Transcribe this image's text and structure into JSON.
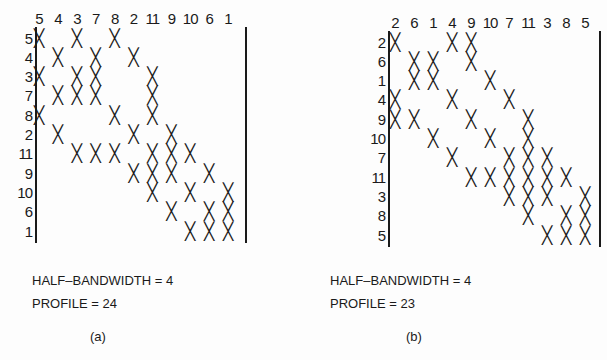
{
  "figure": {
    "panels": [
      {
        "id": "a",
        "label": "(a)",
        "column_order": [
          "5",
          "4",
          "3",
          "7",
          "8",
          "2",
          "11",
          "9",
          "10",
          "6",
          "1"
        ],
        "row_order": [
          "5",
          "4",
          "3",
          "7",
          "8",
          "2",
          "11",
          "9",
          "10",
          "6",
          "1"
        ],
        "mark": "X",
        "nonzeros": [
          [
            0,
            2,
            4
          ],
          [
            1,
            3,
            5
          ],
          [
            0,
            2,
            3,
            6
          ],
          [
            1,
            2,
            3,
            6
          ],
          [
            0,
            4,
            6
          ],
          [
            1,
            5,
            7
          ],
          [
            2,
            3,
            4,
            6,
            7,
            8
          ],
          [
            5,
            6,
            7,
            9
          ],
          [
            6,
            8,
            10
          ],
          [
            7,
            9,
            10
          ],
          [
            8,
            9,
            10
          ]
        ],
        "half_bandwidth_label": "HALF–BANDWIDTH = 4",
        "profile_label": "PROFILE = 24"
      },
      {
        "id": "b",
        "label": "(b)",
        "column_order": [
          "2",
          "6",
          "1",
          "4",
          "9",
          "10",
          "7",
          "11",
          "3",
          "8",
          "5"
        ],
        "row_order": [
          "2",
          "6",
          "1",
          "4",
          "9",
          "10",
          "7",
          "11",
          "3",
          "8",
          "5"
        ],
        "mark": "X",
        "nonzeros": [
          [
            0,
            3,
            4
          ],
          [
            1,
            2,
            4
          ],
          [
            1,
            2,
            5
          ],
          [
            0,
            3,
            6
          ],
          [
            0,
            1,
            4,
            7
          ],
          [
            2,
            5,
            7
          ],
          [
            3,
            6,
            7,
            8
          ],
          [
            4,
            5,
            6,
            7,
            8,
            9
          ],
          [
            6,
            7,
            8,
            10
          ],
          [
            7,
            9,
            10
          ],
          [
            8,
            9,
            10
          ]
        ],
        "half_bandwidth_label": "HALF–BANDWIDTH = 4",
        "profile_label": "PROFILE = 23"
      }
    ]
  }
}
